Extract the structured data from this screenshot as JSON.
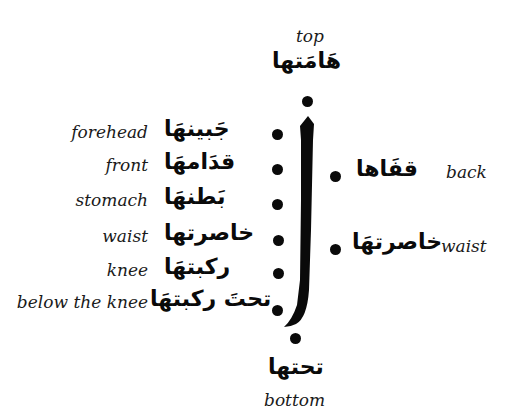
{
  "diagram": {
    "center_glyph": "أ",
    "top": {
      "arabic": "هَامَتها",
      "english": "top"
    },
    "bottom": {
      "arabic": "تحتها",
      "english": "bottom"
    },
    "left_positions": [
      {
        "arabic": "جَبينهَا",
        "english": "forehead"
      },
      {
        "arabic": "قدَامهَا",
        "english": "front"
      },
      {
        "arabic": "بَطنهَا",
        "english": "stomach"
      },
      {
        "arabic": "خاصرتها",
        "english": "waist"
      },
      {
        "arabic": "ركبتهَا",
        "english": "knee"
      },
      {
        "arabic": "تحتَ ركبتهَا",
        "english": "below the knee"
      }
    ],
    "right_positions": [
      {
        "arabic": "قفَاها",
        "english": "back"
      },
      {
        "arabic": "خاصرتهَا",
        "english": "waist"
      }
    ],
    "colors": {
      "ink": "#0a0a0a",
      "background": "#ffffff"
    }
  }
}
